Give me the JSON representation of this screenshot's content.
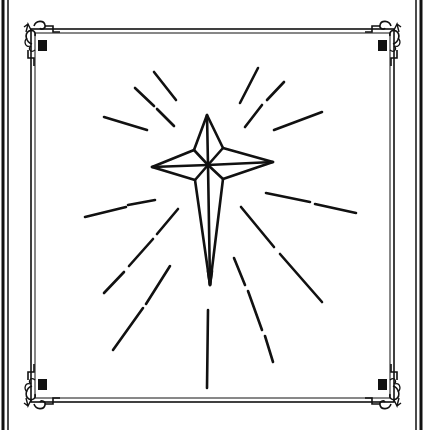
{
  "illustration": {
    "subject": "star-with-light-rays",
    "style": "black line art on white",
    "colors": {
      "ink": "#111111",
      "paper": "#ffffff"
    }
  },
  "frame": {
    "outer_lines": {
      "left": [
        3,
        8
      ],
      "right": [
        417,
        421
      ]
    },
    "inner_frame": {
      "x": 30,
      "y": 28,
      "width": 366,
      "height": 376
    },
    "corner_ornament": "fleur-de-lis-scroll-icon"
  },
  "star": {
    "top": [
      207,
      115
    ],
    "left": [
      152,
      167
    ],
    "right": [
      273,
      162
    ],
    "bottom": [
      210,
      285
    ],
    "center": [
      208,
      165
    ],
    "inner_ul": [
      194,
      150
    ],
    "inner_ur": [
      223,
      148
    ],
    "inner_ll": [
      195,
      180
    ],
    "inner_lr": [
      223,
      179
    ]
  },
  "rays": [
    {
      "segments": [
        [
          [
            154,
            72
          ],
          [
            176,
            100
          ]
        ]
      ]
    },
    {
      "segments": [
        [
          [
            135,
            88
          ],
          [
            154,
            106
          ]
        ],
        [
          [
            157,
            109
          ],
          [
            174,
            126
          ]
        ]
      ]
    },
    {
      "segments": [
        [
          [
            104,
            117
          ],
          [
            147,
            130
          ]
        ]
      ]
    },
    {
      "segments": [
        [
          [
            258,
            68
          ],
          [
            240,
            103
          ]
        ]
      ]
    },
    {
      "segments": [
        [
          [
            284,
            82
          ],
          [
            267,
            100
          ]
        ],
        [
          [
            262,
            105
          ],
          [
            245,
            127
          ]
        ]
      ]
    },
    {
      "segments": [
        [
          [
            322,
            112
          ],
          [
            274,
            130
          ]
        ]
      ]
    },
    {
      "segments": [
        [
          [
            155,
            200
          ],
          [
            128,
            205
          ]
        ],
        [
          [
            126,
            207
          ],
          [
            85,
            217
          ]
        ]
      ]
    },
    {
      "segments": [
        [
          [
            178,
            209
          ],
          [
            157,
            234
          ]
        ],
        [
          [
            153,
            239
          ],
          [
            129,
            266
          ]
        ],
        [
          [
            124,
            272
          ],
          [
            104,
            293
          ]
        ]
      ]
    },
    {
      "segments": [
        [
          [
            170,
            266
          ],
          [
            146,
            304
          ]
        ],
        [
          [
            143,
            308
          ],
          [
            113,
            350
          ]
        ]
      ]
    },
    {
      "segments": [
        [
          [
            266,
            193
          ],
          [
            310,
            202
          ]
        ],
        [
          [
            315,
            204
          ],
          [
            356,
            213
          ]
        ]
      ]
    },
    {
      "segments": [
        [
          [
            241,
            207
          ],
          [
            274,
            247
          ]
        ],
        [
          [
            280,
            254
          ],
          [
            322,
            302
          ]
        ]
      ]
    },
    {
      "segments": [
        [
          [
            234,
            258
          ],
          [
            245,
            285
          ]
        ],
        [
          [
            248,
            291
          ],
          [
            262,
            330
          ]
        ],
        [
          [
            265,
            336
          ],
          [
            273,
            362
          ]
        ]
      ]
    },
    {
      "segments": [
        [
          [
            208,
            310
          ],
          [
            207,
            388
          ]
        ]
      ]
    }
  ]
}
